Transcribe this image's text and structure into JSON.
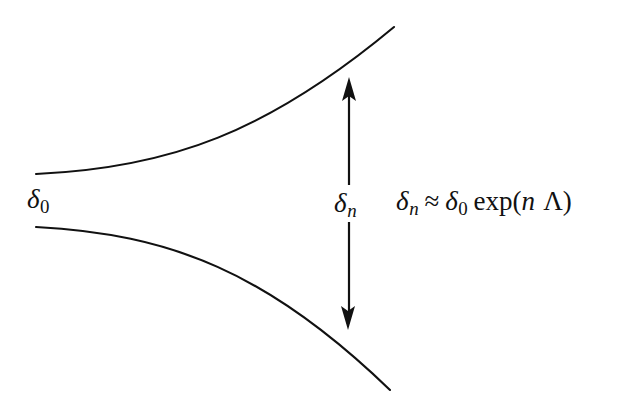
{
  "figure": {
    "kind": "line-diagram",
    "background_color": "#ffffff",
    "stroke_color": "#111111"
  },
  "labels": {
    "delta_initial": {
      "symbol": "δ",
      "subscript": "0",
      "plain_text": "δ₀"
    },
    "delta_after_n": {
      "symbol": "δ",
      "subscript": "n",
      "plain_text": "δₙ"
    }
  },
  "equation": {
    "plain_text": "δₙ ≈ δ₀ exp(n Λ)",
    "lhs_symbol": "δ",
    "lhs_subscript": "n",
    "relation": "≈",
    "rhs_symbol": "δ",
    "rhs_subscript": "0",
    "function_name": "exp",
    "open_paren": "(",
    "arg_index": "n",
    "arg_exponent": "Λ",
    "close_paren": ")"
  },
  "geometry": {
    "upper_curve": {
      "start": [
        36,
        174
      ],
      "control_1": [
        170,
        168
      ],
      "control_2": [
        268,
        132
      ],
      "end": [
        394,
        27
      ]
    },
    "lower_curve": {
      "start": [
        36,
        227
      ],
      "control_1": [
        170,
        234
      ],
      "control_2": [
        268,
        272
      ],
      "end": [
        390,
        390
      ]
    },
    "arrow": {
      "x": 349,
      "top_tip": [
        349,
        77
      ],
      "top_shaft_end": [
        349,
        185
      ],
      "bottom_shaft_start": [
        349,
        222
      ],
      "bottom_tip": [
        348,
        330
      ],
      "head_length": 20,
      "head_half_width": 7,
      "stroke_width": 2.2
    },
    "curve_stroke_width": 2.1
  }
}
